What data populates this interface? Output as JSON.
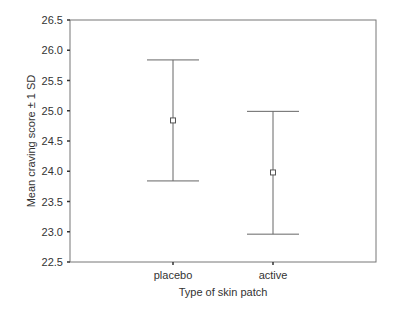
{
  "chart_data": {
    "type": "errorbar",
    "title": "",
    "xlabel": "Type of skin patch",
    "ylabel": "Mean craving score ± 1 SD",
    "categories": [
      "placebo",
      "active"
    ],
    "series": [
      {
        "name": "Mean craving score",
        "means": [
          24.84,
          23.98
        ],
        "upper": [
          25.84,
          24.99
        ],
        "lower": [
          23.84,
          22.96
        ]
      }
    ],
    "ylim": [
      22.5,
      26.5
    ],
    "yticks": [
      "22.5",
      "23.0",
      "23.5",
      "24.0",
      "24.5",
      "25.0",
      "25.5",
      "26.0",
      "26.5"
    ],
    "grid": false,
    "legend": null
  }
}
